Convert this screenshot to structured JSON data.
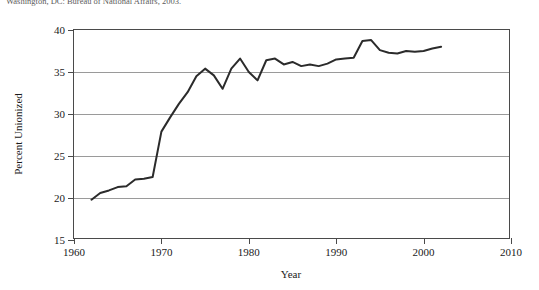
{
  "citation": {
    "text": "Washington, DC: Bureau of National Affairs, 2003."
  },
  "axes": {
    "ylabel": "Percent Unionized",
    "xlabel": "Year",
    "yticks": [
      "15",
      "20",
      "25",
      "30",
      "35",
      "40"
    ],
    "xticks": [
      "1960",
      "1970",
      "1980",
      "1990",
      "2000",
      "2010"
    ]
  },
  "chart_data": {
    "type": "line",
    "title": "",
    "xlabel": "Year",
    "ylabel": "Percent Unionized",
    "xlim": [
      1960,
      2010
    ],
    "ylim": [
      15,
      40
    ],
    "xticks": [
      1960,
      1970,
      1980,
      1990,
      2000,
      2010
    ],
    "yticks": [
      15,
      20,
      25,
      30,
      35,
      40
    ],
    "grid": "horizontal",
    "legend": "none",
    "line_color": "#2b2b2b",
    "line_width": 2,
    "series": [
      {
        "name": "Percent Unionized",
        "x": [
          1962,
          1963,
          1964,
          1965,
          1966,
          1967,
          1968,
          1969,
          1970,
          1971,
          1972,
          1973,
          1974,
          1975,
          1976,
          1977,
          1978,
          1979,
          1980,
          1981,
          1982,
          1983,
          1984,
          1985,
          1986,
          1987,
          1988,
          1989,
          1990,
          1991,
          1992,
          1993,
          1994,
          1995,
          1996,
          1997,
          1998,
          1999,
          2000,
          2001,
          2002
        ],
        "values": [
          19.8,
          20.6,
          20.9,
          21.3,
          21.4,
          22.2,
          22.3,
          22.5,
          27.9,
          29.6,
          31.2,
          32.6,
          34.5,
          35.4,
          34.6,
          33.0,
          35.4,
          36.6,
          35.0,
          34.0,
          36.4,
          36.6,
          35.9,
          36.2,
          35.7,
          35.9,
          35.7,
          36.0,
          36.5,
          36.6,
          36.7,
          38.7,
          38.8,
          37.6,
          37.3,
          37.2,
          37.5,
          37.4,
          37.5,
          37.8,
          38.0
        ]
      }
    ]
  }
}
